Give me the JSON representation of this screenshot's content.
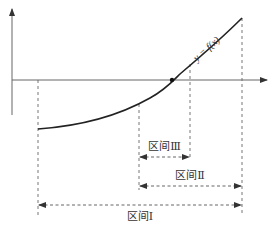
{
  "diagram": {
    "type": "function-interval-diagram",
    "function_label": "y = f(x)",
    "colors": {
      "axis": "#555555",
      "curve": "#222222",
      "dashed": "#555555",
      "text": "#333333",
      "background": "#ffffff"
    },
    "axes": {
      "x_axis": {
        "y": 80,
        "x_start": 12,
        "x_end": 268
      },
      "y_axis": {
        "x": 12,
        "y_start": 115,
        "y_end": 8
      }
    },
    "curve": {
      "start": [
        38,
        129
      ],
      "root": [
        172,
        80
      ],
      "end": [
        242,
        18
      ]
    },
    "guides": [
      {
        "x": 38,
        "y_top": 80,
        "y_bottom": 215
      },
      {
        "x": 139,
        "y_top": 104,
        "y_bottom": 190
      },
      {
        "x": 190,
        "y_top": 63,
        "y_bottom": 156
      },
      {
        "x": 242,
        "y_top": 18,
        "y_bottom": 215
      }
    ],
    "intervals": [
      {
        "name": "interval-3",
        "label": "区间Ⅲ",
        "x_start": 139,
        "x_end": 190,
        "y": 157,
        "label_y": 150
      },
      {
        "name": "interval-2",
        "label": "区间Ⅱ",
        "x_start": 139,
        "x_end": 242,
        "y": 186,
        "label_y": 179
      },
      {
        "name": "interval-1",
        "label": "区间Ⅰ",
        "x_start": 38,
        "x_end": 242,
        "y": 205,
        "label_y": 220
      }
    ]
  }
}
